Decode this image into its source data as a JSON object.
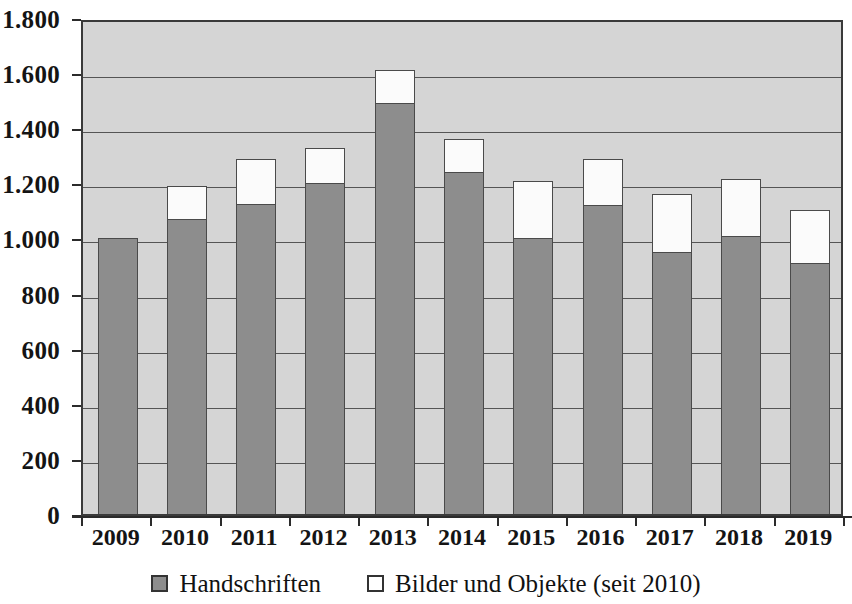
{
  "chart_data": {
    "type": "bar",
    "stacked": true,
    "title": "",
    "subtitle": "",
    "xlabel": "",
    "ylabel": "",
    "categories": [
      "2009",
      "2010",
      "2011",
      "2012",
      "2013",
      "2014",
      "2015",
      "2016",
      "2017",
      "2018",
      "2019"
    ],
    "series": [
      {
        "name": "Handschriften",
        "color": "#8d8d8d",
        "values": [
          1000,
          1070,
          1125,
          1200,
          1490,
          1240,
          1000,
          1120,
          950,
          1010,
          910
        ]
      },
      {
        "name": "Bilder und Objekte (seit 2010)",
        "color": "#ffffff",
        "values": [
          0,
          120,
          165,
          130,
          120,
          120,
          210,
          170,
          210,
          205,
          195
        ]
      }
    ],
    "totals": [
      1000,
      1190,
      1290,
      1330,
      1610,
      1360,
      1210,
      1290,
      1160,
      1215,
      1105
    ],
    "ylim": [
      0,
      1800
    ],
    "ytick_values": [
      0,
      200,
      400,
      600,
      800,
      1000,
      1200,
      1400,
      1600,
      1800
    ],
    "ytick_labels": [
      "0",
      "200",
      "400",
      "600",
      "800",
      "1.000",
      "1.200",
      "1.400",
      "1.600",
      "1.800"
    ],
    "grid": true,
    "grid_axis": "y",
    "legend_position": "bottom",
    "legend": [
      {
        "label": "Handschriften",
        "swatch": "gray"
      },
      {
        "label": "Bilder und Objekte (seit 2010)",
        "swatch": "white"
      }
    ],
    "plot_background": "#d5d5d5",
    "axis_color": "#2b2b2b"
  }
}
